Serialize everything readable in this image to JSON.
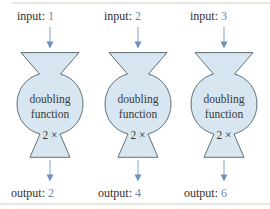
{
  "machines": [
    {
      "input_label": "input:",
      "input_value": "1",
      "body": {
        "line1": "doubling",
        "line2": "function",
        "operation": "2 ×"
      },
      "output_label": "output:",
      "output_value": "2"
    },
    {
      "input_label": "input:",
      "input_value": "2",
      "body": {
        "line1": "doubling",
        "line2": "function",
        "operation": "2 ×"
      },
      "output_label": "output:",
      "output_value": "4"
    },
    {
      "input_label": "input:",
      "input_value": "3",
      "body": {
        "line1": "doubling",
        "line2": "function",
        "operation": "2 ×"
      },
      "output_label": "output:",
      "output_value": "6"
    }
  ],
  "colors": {
    "machine_fill": "#d7e6f0",
    "machine_stroke": "#5f7078",
    "value_text": "#6787b5",
    "arrow_line": "#9db8d8",
    "arrow_head": "#6e93bd",
    "label_text": "#2f2f2f",
    "rule_line": "#e9e6e0"
  }
}
